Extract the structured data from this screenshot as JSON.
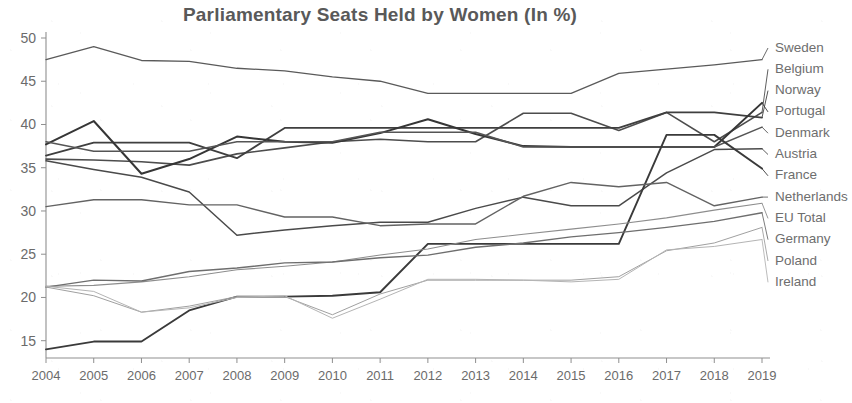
{
  "chart_data": {
    "type": "line",
    "title": "Parliamentary Seats Held by Women (In %)",
    "xlabel": "",
    "ylabel": "",
    "grid": false,
    "legend_position": "right-endpoint-labels",
    "xlim": [
      2004,
      2019
    ],
    "ylim": [
      13,
      50
    ],
    "yticks": [
      15,
      20,
      25,
      30,
      35,
      40,
      45,
      50
    ],
    "x": [
      2004,
      2005,
      2006,
      2007,
      2008,
      2009,
      2010,
      2011,
      2012,
      2013,
      2014,
      2015,
      2016,
      2017,
      2018,
      2019
    ],
    "xticklabels": [
      "2004",
      "2005",
      "2006",
      "2007",
      "2008",
      "2009",
      "2010",
      "2011",
      "2012",
      "2013",
      "2014",
      "2015",
      "2016",
      "2017",
      "2018",
      "2019"
    ],
    "series": [
      {
        "name": "Sweden",
        "color": "#5a5a5a",
        "width": 1.3,
        "values": [
          47.5,
          49.0,
          47.4,
          47.3,
          46.5,
          46.2,
          45.5,
          45.0,
          43.6,
          43.6,
          43.6,
          43.6,
          45.9,
          46.4,
          46.9,
          47.5
        ]
      },
      {
        "name": "Belgium",
        "color": "#4d4d4d",
        "width": 1.6,
        "values": [
          36.0,
          35.9,
          35.7,
          35.3,
          36.6,
          37.3,
          38.0,
          38.3,
          38.0,
          38.0,
          41.3,
          41.3,
          39.3,
          41.4,
          38.0,
          41.4
        ]
      },
      {
        "name": "Norway",
        "color": "#3f3f3f",
        "width": 1.8,
        "values": [
          36.4,
          37.9,
          37.9,
          37.9,
          36.1,
          39.6,
          39.6,
          39.6,
          39.6,
          39.6,
          39.6,
          39.6,
          39.6,
          41.4,
          41.4,
          40.8
        ]
      },
      {
        "name": "Portugal",
        "color": "#363636",
        "width": 2.0,
        "values": [
          37.7,
          40.4,
          34.3,
          36.0,
          38.6,
          38.0,
          37.9,
          39.0,
          40.6,
          38.9,
          37.5,
          37.4,
          37.4,
          37.4,
          37.4,
          42.5
        ]
      },
      {
        "name": "Denmark",
        "color": "#555555",
        "width": 1.5,
        "values": [
          38.0,
          36.9,
          36.9,
          36.9,
          38.0,
          38.0,
          38.0,
          39.1,
          39.1,
          39.1,
          37.4,
          37.4,
          37.4,
          37.4,
          37.4,
          39.7
        ]
      },
      {
        "name": "Austria",
        "color": "#4a4a4a",
        "width": 1.5,
        "values": [
          35.8,
          34.8,
          33.9,
          32.2,
          27.2,
          27.8,
          28.3,
          28.7,
          28.7,
          30.3,
          31.6,
          30.6,
          30.6,
          34.4,
          37.1,
          37.2
        ]
      },
      {
        "name": "France",
        "color": "#3a3a3a",
        "width": 1.9,
        "values": [
          14.0,
          14.9,
          14.9,
          18.5,
          20.1,
          20.1,
          20.2,
          20.6,
          26.2,
          26.2,
          26.2,
          26.2,
          26.2,
          38.8,
          38.8,
          34.9
        ]
      },
      {
        "name": "Netherlands",
        "color": "#636363",
        "width": 1.4,
        "values": [
          30.5,
          31.3,
          31.3,
          30.7,
          30.7,
          29.3,
          29.3,
          28.3,
          28.5,
          28.5,
          31.7,
          33.3,
          32.8,
          33.3,
          30.6,
          31.6
        ]
      },
      {
        "name": "EU Total",
        "color": "#8d8d8d",
        "width": 1.1,
        "values": [
          21.3,
          21.4,
          21.8,
          22.4,
          23.2,
          23.6,
          24.1,
          24.9,
          25.6,
          26.7,
          27.3,
          27.9,
          28.5,
          29.2,
          30.1,
          30.9
        ]
      },
      {
        "name": "Germany",
        "color": "#6e6e6e",
        "width": 1.4,
        "values": [
          21.2,
          22.0,
          21.9,
          23.0,
          23.4,
          24.0,
          24.1,
          24.6,
          24.9,
          25.8,
          26.3,
          27.0,
          27.5,
          28.1,
          28.8,
          29.8
        ]
      },
      {
        "name": "Poland",
        "color": "#a0a0a0",
        "width": 1.0,
        "values": [
          21.2,
          20.2,
          18.3,
          19.0,
          20.1,
          20.1,
          18.0,
          20.4,
          22.0,
          22.0,
          22.0,
          22.0,
          22.4,
          25.4,
          26.3,
          28.1
        ]
      },
      {
        "name": "Ireland",
        "color": "#b4b4b4",
        "width": 1.0,
        "values": [
          21.3,
          20.7,
          18.3,
          18.8,
          20.0,
          20.2,
          17.6,
          19.8,
          22.1,
          22.1,
          22.0,
          21.8,
          22.1,
          25.5,
          25.9,
          26.7
        ]
      }
    ],
    "legend_labels": [
      "Sweden",
      "Belgium",
      "Norway",
      "Portugal",
      "Denmark",
      "Austria",
      "France",
      "Netherlands",
      "EU Total",
      "Germany",
      "Poland",
      "Ireland"
    ]
  }
}
